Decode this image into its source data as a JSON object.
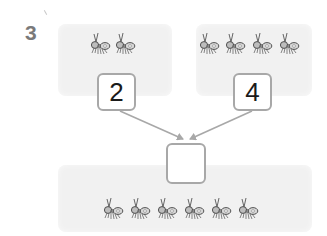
{
  "question": {
    "number": "3"
  },
  "groups": {
    "left": {
      "ant_count": 2,
      "value": "2"
    },
    "right": {
      "ant_count": 4,
      "value": "4"
    },
    "total": {
      "ant_count": 6,
      "value": ""
    }
  },
  "icons": {
    "ant": "ant-icon",
    "arrow": "arrow-icon"
  },
  "colors": {
    "panel": "#f1f1f1",
    "box_border": "#a8a8a8",
    "arrow": "#a8a8a8",
    "question_number": "#7a7a7a",
    "digit": "#1a1a1a"
  }
}
